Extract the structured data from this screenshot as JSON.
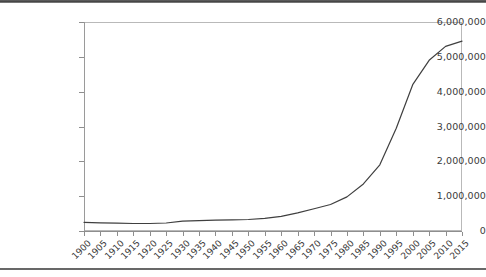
{
  "document": {
    "background_color": "#ffffff",
    "scan_band_color": "#4c4c4c"
  },
  "chart_data": {
    "type": "line",
    "title": "",
    "subtitle": "",
    "xlabel": "",
    "ylabel": "",
    "grid": false,
    "legend": "none",
    "line_color": "#3f3f3f",
    "frame_color": "#b9b9b9",
    "axis_color": "#8e8e8e",
    "xlim": [
      1900,
      2015
    ],
    "ylim": [
      0,
      6000000
    ],
    "y_tick_step": 1000000,
    "y_ticks": [
      0,
      1000000,
      2000000,
      3000000,
      4000000,
      5000000,
      6000000
    ],
    "y_tick_labels": [
      "0",
      "1,000,000",
      "2,000,000",
      "3,000,000",
      "4,000,000",
      "5,000,000",
      "6,000,000"
    ],
    "x_tick_step": 5,
    "categories": [
      "1900",
      "1905",
      "1910",
      "1915",
      "1920",
      "1925",
      "1930",
      "1935",
      "1940",
      "1945",
      "1950",
      "1955",
      "1960",
      "1965",
      "1970",
      "1975",
      "1980",
      "1985",
      "1990",
      "1995",
      "2000",
      "2005",
      "2010",
      "2015"
    ],
    "x": [
      1900,
      1905,
      1910,
      1915,
      1920,
      1925,
      1930,
      1935,
      1940,
      1945,
      1950,
      1955,
      1960,
      1965,
      1970,
      1975,
      1980,
      1985,
      1990,
      1995,
      2000,
      2005,
      2010,
      2015
    ],
    "values": [
      250000,
      235000,
      225000,
      215000,
      215000,
      230000,
      285000,
      300000,
      310000,
      320000,
      330000,
      360000,
      420000,
      520000,
      640000,
      760000,
      980000,
      1350000,
      1900000,
      2950000,
      4200000,
      4900000,
      5300000,
      5450000
    ],
    "series": [
      {
        "name": "series-1",
        "values": [
          250000,
          235000,
          225000,
          215000,
          215000,
          230000,
          285000,
          300000,
          310000,
          320000,
          330000,
          360000,
          420000,
          520000,
          640000,
          760000,
          980000,
          1350000,
          1900000,
          2950000,
          4200000,
          4900000,
          5300000,
          5450000
        ]
      }
    ]
  }
}
